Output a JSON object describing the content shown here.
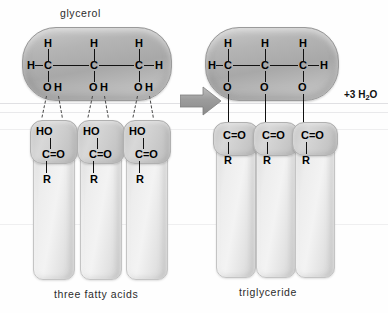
{
  "diagram": {
    "labels": {
      "glycerol": "glycerol",
      "fatty_acids": "three fatty acids",
      "product": "triglyceride"
    },
    "byproduct": {
      "prefix": "+3 H",
      "subscript": "2",
      "suffix": "O",
      "full": "+3 H2O"
    }
  },
  "reactant_glycerol": {
    "name": "glycerol",
    "terminal_h_left": "H",
    "terminal_h_right": "H",
    "upper_hydrogens": [
      "H",
      "H",
      "H"
    ],
    "carbons": [
      "C",
      "C",
      "C"
    ],
    "hydroxyls": [
      {
        "o": "O",
        "h": "H"
      },
      {
        "o": "O",
        "h": "H"
      },
      {
        "o": "O",
        "h": "H"
      }
    ]
  },
  "fatty_acids": {
    "label": "three fatty acids",
    "count": 3,
    "units": [
      {
        "hydroxyl": "HO",
        "carbonyl": "C=O",
        "chain": "R"
      },
      {
        "hydroxyl": "HO",
        "carbonyl": "C=O",
        "chain": "R"
      },
      {
        "hydroxyl": "HO",
        "carbonyl": "C=O",
        "chain": "R"
      }
    ]
  },
  "product_glycerol": {
    "name": "triglyceride",
    "terminal_h_left": "H",
    "terminal_h_right": "H",
    "upper_hydrogens": [
      "H",
      "H",
      "H"
    ],
    "carbons": [
      "C",
      "C",
      "C"
    ],
    "ester_oxygens": [
      "O",
      "O",
      "O"
    ]
  },
  "product_chains": {
    "label": "triglyceride",
    "count": 3,
    "units": [
      {
        "carbonyl": "C=O",
        "chain": "R"
      },
      {
        "carbonyl": "C=O",
        "chain": "R"
      },
      {
        "carbonyl": "C=O",
        "chain": "R"
      }
    ]
  },
  "arrow": {
    "name": "reaction-arrow",
    "direction": "right"
  },
  "colors": {
    "background": "#fefefe",
    "glycerol_body": "#b4b4b4",
    "chain_body": "#e9e9e9",
    "text": "#2b2b2b",
    "bond": "#111111",
    "arrow": "#9a9a9a"
  }
}
